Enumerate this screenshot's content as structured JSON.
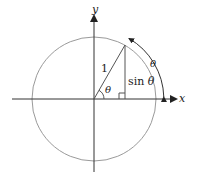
{
  "figure": {
    "labels": {
      "x_axis": "x",
      "y_axis": "y",
      "radius": "1",
      "angle_at_origin": "θ",
      "arc_length": "θ",
      "opposite_side_prefix": "sin ",
      "opposite_side_symbol": "θ"
    },
    "colors": {
      "axis": "#333333",
      "circle": "#9a9a9a",
      "lines": "#555555",
      "text": "#222222"
    }
  }
}
